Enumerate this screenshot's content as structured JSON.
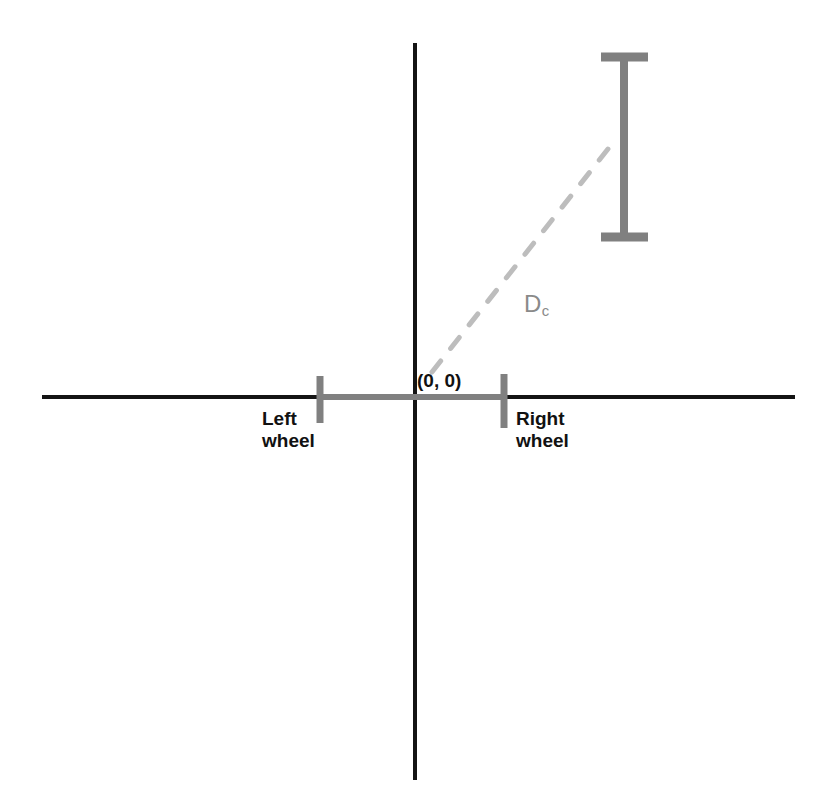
{
  "figure": {
    "background_color": "#ffffff",
    "width": 830,
    "height": 810
  },
  "axes": {
    "color": "#141414",
    "stroke_width": 4,
    "horizontal": {
      "name": "x-axis",
      "x1": 42,
      "y1": 397,
      "x2": 795,
      "y2": 397
    },
    "vertical": {
      "name": "y-axis",
      "x1": 415,
      "y1": 43,
      "x2": 415,
      "y2": 780
    }
  },
  "robot": {
    "axle": {
      "color": "#808080",
      "stroke_width": 6,
      "x1": 320,
      "y1": 397,
      "x2": 505,
      "y2": 397
    },
    "left_wheel": {
      "label": "Left\nwheel",
      "color": "#808080",
      "x": 320,
      "y_top": 376,
      "y_bottom": 423,
      "stroke_width": 7
    },
    "right_wheel": {
      "label": "Right\nwheel",
      "color": "#808080",
      "x": 504,
      "y_top": 374,
      "y_bottom": 428,
      "stroke_width": 7
    }
  },
  "origin": {
    "label": "(0, 0)",
    "color": "#111111",
    "x": 415,
    "y": 397
  },
  "distance": {
    "label": "D",
    "subscript": "c",
    "color": "#8a8a8a",
    "leader_line": {
      "name": "dashed-distance-line",
      "style": "dashed",
      "color": "#bdbdbd",
      "stroke_width": 5,
      "dash": "14 16",
      "x1": 432,
      "y1": 372,
      "x2": 608,
      "y2": 149
    }
  },
  "target_marker": {
    "name": "i-beam-target",
    "color": "#808080",
    "stem": {
      "x": 624,
      "y_top": 55,
      "y_bottom": 240,
      "stroke_width": 8
    },
    "cap_top": {
      "x1": 601,
      "x2": 648,
      "y": 57,
      "stroke_width": 9
    },
    "cap_bottom": {
      "x1": 601,
      "x2": 648,
      "y": 237,
      "stroke_width": 9
    }
  }
}
